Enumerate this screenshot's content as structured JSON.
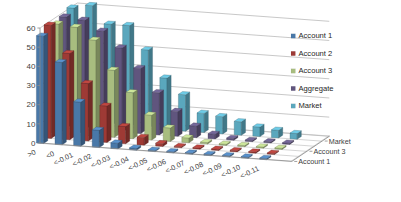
{
  "chart_data": {
    "type": "bar",
    "title": "",
    "subtitle": "",
    "xlabel": "",
    "ylabel": "",
    "zlabel": "",
    "ylim": [
      0,
      60
    ],
    "yticks": [
      0,
      10,
      20,
      30,
      40,
      50,
      60
    ],
    "grid": true,
    "projection": "3d",
    "legend_position": "right",
    "categories": [
      ">0",
      "<0",
      "<-0.01",
      "<-0.02",
      "<-0.03",
      "<-0.04",
      "<-0.05",
      "<-0.06",
      "<-0.07",
      "<-0.08",
      "<-0.09",
      "<-0.10",
      "<-0.11"
    ],
    "depth_axis_labels": [
      "Account 1",
      "Account 3",
      "Market"
    ],
    "series": [
      {
        "name": "Account 1",
        "color": "#4978a8",
        "values": [
          56,
          43,
          23,
          9,
          3,
          1,
          0.5,
          0.3,
          0.2,
          0.2,
          0.1,
          0.1,
          0.1
        ]
      },
      {
        "name": "Account 2",
        "color": "#9e3a35",
        "values": [
          59,
          45,
          30,
          19,
          9,
          4,
          1.5,
          0.6,
          0.3,
          0.2,
          0.2,
          0.1,
          0.1
        ]
      },
      {
        "name": "Account 3",
        "color": "#a8bd7f",
        "values": [
          57,
          56,
          50,
          35,
          24,
          13,
          7,
          2.5,
          0.8,
          0.4,
          0.3,
          0.2,
          0.1
        ]
      },
      {
        "name": "Aggregate",
        "color": "#60557e",
        "values": [
          58,
          57,
          52,
          44,
          34,
          22,
          13,
          6,
          2.5,
          1,
          0.5,
          0.3,
          0.2
        ]
      },
      {
        "name": "Market",
        "color": "#5aa7bd",
        "values": [
          60,
          62,
          53,
          53,
          41,
          27,
          19,
          10,
          9,
          7,
          5,
          4,
          3
        ]
      }
    ]
  },
  "legend": {
    "items": [
      {
        "label": "Account 1",
        "color": "#4978a8"
      },
      {
        "label": "Account 2",
        "color": "#9e3a35"
      },
      {
        "label": "Account 3",
        "color": "#a8bd7f"
      },
      {
        "label": "Aggregate",
        "color": "#60557e"
      },
      {
        "label": "Market",
        "color": "#5aa7bd"
      }
    ]
  },
  "axes": {
    "y_tick_labels": [
      "0",
      "10",
      "20",
      "30",
      "40",
      "50",
      "60"
    ],
    "x_tick_labels": [
      ">0",
      "<0",
      "<-0.01",
      "<-0.02",
      "<-0.03",
      "<-0.04",
      "<-0.05",
      "<-0.06",
      "<-0.07",
      "<-0.08",
      "<-0.09",
      "<-0.10",
      "<-0.11"
    ],
    "z_tick_labels": [
      "Market",
      "Account 3",
      "Account 1"
    ]
  }
}
